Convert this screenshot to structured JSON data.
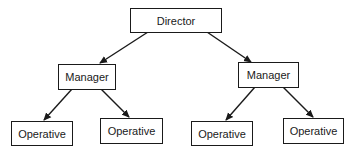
{
  "diagram": {
    "type": "org-chart",
    "nodes": [
      {
        "id": "director",
        "label": "Director",
        "level": 0
      },
      {
        "id": "manager-left",
        "label": "Manager",
        "level": 1,
        "parent": "director"
      },
      {
        "id": "manager-right",
        "label": "Manager",
        "level": 1,
        "parent": "director"
      },
      {
        "id": "operative-1",
        "label": "Operative",
        "level": 2,
        "parent": "manager-left"
      },
      {
        "id": "operative-2",
        "label": "Operative",
        "level": 2,
        "parent": "manager-left"
      },
      {
        "id": "operative-3",
        "label": "Operative",
        "level": 2,
        "parent": "manager-right"
      },
      {
        "id": "operative-4",
        "label": "Operative",
        "level": 2,
        "parent": "manager-right"
      }
    ],
    "edges": [
      {
        "from": "director",
        "to": "manager-left"
      },
      {
        "from": "director",
        "to": "manager-right"
      },
      {
        "from": "manager-left",
        "to": "operative-1"
      },
      {
        "from": "manager-left",
        "to": "operative-2"
      },
      {
        "from": "manager-right",
        "to": "operative-3"
      },
      {
        "from": "manager-right",
        "to": "operative-4"
      }
    ],
    "line_color": "#1a1a1a"
  }
}
